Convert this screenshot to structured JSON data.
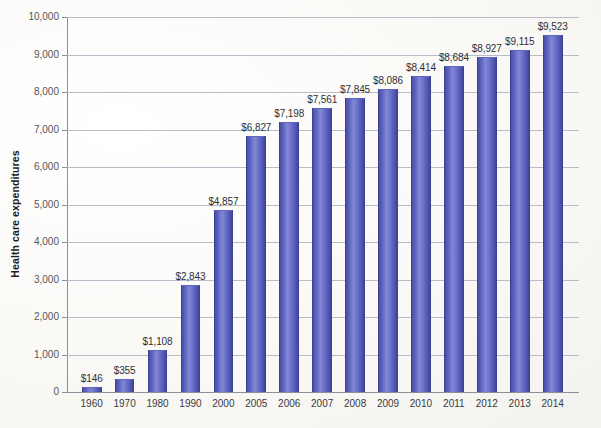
{
  "chart_data": {
    "type": "bar",
    "title": "",
    "xlabel": "",
    "ylabel": "Health care expenditures",
    "ylim": [
      0,
      10000
    ],
    "ytick_step": 1000,
    "grid": true,
    "legend": "none",
    "bar_color": "#5b61bb",
    "categories": [
      "1960",
      "1970",
      "1980",
      "1990",
      "2000",
      "2005",
      "2006",
      "2007",
      "2008",
      "2009",
      "2010",
      "2011",
      "2012",
      "2013",
      "2014"
    ],
    "values": [
      146,
      355,
      1108,
      2843,
      4857,
      6827,
      7198,
      7561,
      7845,
      8086,
      8414,
      8684,
      8927,
      9115,
      9523
    ],
    "value_labels": [
      "$146",
      "$355",
      "$1,108",
      "$2,843",
      "$4,857",
      "$6,827",
      "$7,198",
      "$7,561",
      "$7,845",
      "$8,086",
      "$8,414",
      "$8,684",
      "$8,927",
      "$9,115",
      "$9,523"
    ],
    "ytick_labels": [
      "0",
      "1,000",
      "2,000",
      "3,000",
      "4,000",
      "5,000",
      "6,000",
      "7,000",
      "8,000",
      "9,000",
      "10,000"
    ],
    "ytick_values": [
      0,
      1000,
      2000,
      3000,
      4000,
      5000,
      6000,
      7000,
      8000,
      9000,
      10000
    ]
  }
}
